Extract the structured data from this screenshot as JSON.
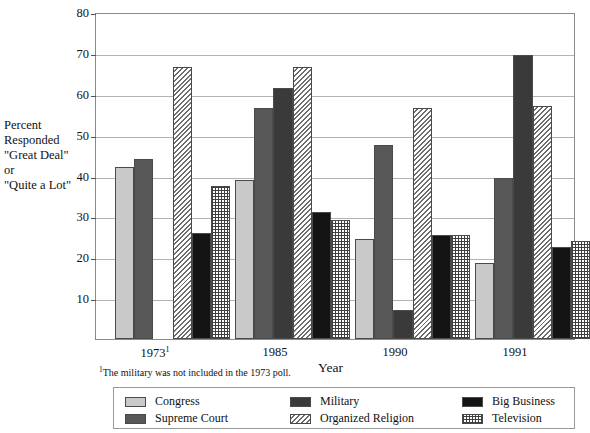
{
  "chart_data": {
    "type": "bar",
    "title": "",
    "xlabel": "Year",
    "ylabel": "Percent Responded \"Great Deal\" or \"Quite a Lot\"",
    "categories": [
      "1973",
      "1985",
      "1990",
      "1991"
    ],
    "category_labels": [
      "1973¹",
      "1985",
      "1990",
      "1991"
    ],
    "ylim": [
      0,
      80
    ],
    "yticks": [
      10,
      20,
      30,
      40,
      50,
      60,
      70,
      80
    ],
    "grid": true,
    "legend_position": "bottom",
    "footnote": "¹The military was not included in the 1973 poll.",
    "series": [
      {
        "name": "Congress",
        "key": "congress",
        "pattern": "solid-light-gray",
        "color": "#c9c9c9",
        "values": [
          42,
          39,
          24.5,
          18.5
        ]
      },
      {
        "name": "Supreme Court",
        "key": "supreme",
        "pattern": "solid-dark-gray",
        "color": "#585858",
        "values": [
          44,
          56.5,
          47.5,
          39.5
        ]
      },
      {
        "name": "Military",
        "key": "military",
        "pattern": "solid-very-dark",
        "color": "#3a3a3a",
        "values": [
          null,
          61.5,
          7,
          69.5
        ]
      },
      {
        "name": "Organized Religion",
        "key": "religion",
        "pattern": "diagonal-hatch",
        "color": "#ffffff",
        "values": [
          66.5,
          66.5,
          56.5,
          57
        ]
      },
      {
        "name": "Big Business",
        "key": "bigbiz",
        "pattern": "solid-black",
        "color": "#141414",
        "values": [
          26,
          31,
          25.5,
          22.5
        ]
      },
      {
        "name": "Television",
        "key": "tv",
        "pattern": "grid-dots",
        "color": "#ffffff",
        "values": [
          37.5,
          29,
          25.5,
          24
        ]
      }
    ]
  },
  "y_caption_lines": [
    "Percent",
    "Responded",
    "\"Great Deal\"",
    "or",
    "\"Quite a Lot\""
  ],
  "legend": {
    "items": [
      {
        "label": "Congress",
        "key": "congress"
      },
      {
        "label": "Military",
        "key": "military"
      },
      {
        "label": "Big Business",
        "key": "bigbiz"
      },
      {
        "label": "Supreme Court",
        "key": "supreme"
      },
      {
        "label": "Organized Religion",
        "key": "religion"
      },
      {
        "label": "Television",
        "key": "tv"
      }
    ]
  },
  "axis": {
    "x_title": "Year",
    "footnote": "¹The military was not included in the 1973 poll."
  }
}
